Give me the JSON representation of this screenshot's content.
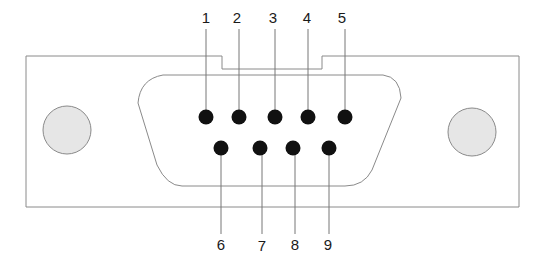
{
  "diagram": {
    "colors": {
      "background": "#ffffff",
      "outline": "#8a8a8a",
      "leader_line": "#777777",
      "mounting_hole_fill": "#e6e6e6",
      "pin_fill": "#111111",
      "label_text": "#1a1a1a"
    },
    "top_row_pins": [
      {
        "number": "1",
        "x": 206,
        "y": 117
      },
      {
        "number": "2",
        "x": 239,
        "y": 117
      },
      {
        "number": "3",
        "x": 275,
        "y": 117
      },
      {
        "number": "4",
        "x": 308,
        "y": 117
      },
      {
        "number": "5",
        "x": 345,
        "y": 117
      }
    ],
    "bottom_row_pins": [
      {
        "number": "6",
        "x": 221,
        "y": 148
      },
      {
        "number": "7",
        "x": 260,
        "y": 148
      },
      {
        "number": "8",
        "x": 293,
        "y": 148
      },
      {
        "number": "9",
        "x": 329,
        "y": 148
      }
    ],
    "mounting_holes": [
      {
        "name": "left",
        "cx": 67,
        "cy": 130,
        "r": 24
      },
      {
        "name": "right",
        "cx": 472,
        "cy": 132,
        "r": 24
      }
    ]
  }
}
